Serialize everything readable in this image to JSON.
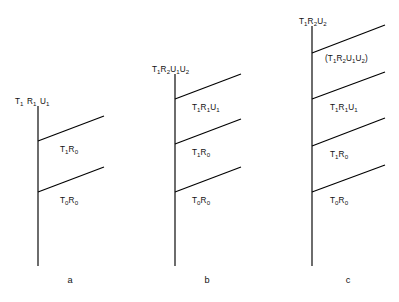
{
  "figure": {
    "type": "energy-level-transition-diagram",
    "background_color": "#ffffff",
    "line_color": "#000000",
    "text_color": "#111111",
    "panels": [
      {
        "id": "a",
        "letter": "a",
        "letter_x": 70,
        "letter_y": 283,
        "trunk": {
          "x": 38,
          "y_top": 106,
          "y_bottom": 266
        },
        "top_label": {
          "text": "T1 R1 U1",
          "parts": [
            {
              "base": "T",
              "sub": "1"
            },
            {
              "space": true
            },
            {
              "base": "R",
              "sub": "1"
            },
            {
              "space": true
            },
            {
              "base": "U",
              "sub": "1"
            }
          ],
          "x": 15,
          "y": 104
        },
        "branches": [
          {
            "name": "branch-T1R0",
            "x1": 38,
            "y1": 141,
            "x2": 104,
            "y2": 116,
            "label": {
              "text": "T1R0",
              "parts": [
                {
                  "base": "T",
                  "sub": "1"
                },
                {
                  "base": "R",
                  "sub": "0"
                }
              ],
              "x": 60,
              "y": 152
            }
          },
          {
            "name": "branch-T0R0",
            "x1": 38,
            "y1": 192,
            "x2": 104,
            "y2": 167,
            "label": {
              "text": "T0R0",
              "parts": [
                {
                  "base": "T",
                  "sub": "0"
                },
                {
                  "base": "R",
                  "sub": "0"
                }
              ],
              "x": 60,
              "y": 203
            }
          }
        ]
      },
      {
        "id": "b",
        "letter": "b",
        "letter_x": 207,
        "letter_y": 283,
        "trunk": {
          "x": 175,
          "y_top": 74,
          "y_bottom": 266
        },
        "top_label": {
          "text": "T1R2U1U2",
          "parts": [
            {
              "base": "T",
              "sub": "1"
            },
            {
              "base": "R",
              "sub": "2"
            },
            {
              "base": "U",
              "sub": "1"
            },
            {
              "base": "U",
              "sub": "2"
            }
          ],
          "x": 152,
          "y": 72
        },
        "branches": [
          {
            "name": "branch-T1R1U1",
            "x1": 175,
            "y1": 99,
            "x2": 241,
            "y2": 74,
            "label": {
              "text": "T1R1U1",
              "parts": [
                {
                  "base": "T",
                  "sub": "1"
                },
                {
                  "base": "R",
                  "sub": "1"
                },
                {
                  "base": "U",
                  "sub": "1"
                }
              ],
              "x": 192,
              "y": 110
            }
          },
          {
            "name": "branch-T1R0",
            "x1": 175,
            "y1": 144,
            "x2": 241,
            "y2": 119,
            "label": {
              "text": "T1R0",
              "parts": [
                {
                  "base": "T",
                  "sub": "1"
                },
                {
                  "base": "R",
                  "sub": "0"
                }
              ],
              "x": 192,
              "y": 155
            }
          },
          {
            "name": "branch-T0R0",
            "x1": 175,
            "y1": 192,
            "x2": 241,
            "y2": 167,
            "label": {
              "text": "T0R0",
              "parts": [
                {
                  "base": "T",
                  "sub": "0"
                },
                {
                  "base": "R",
                  "sub": "0"
                }
              ],
              "x": 192,
              "y": 203
            }
          }
        ]
      },
      {
        "id": "c",
        "letter": "c",
        "letter_x": 348,
        "letter_y": 283,
        "trunk": {
          "x": 312,
          "y_top": 26,
          "y_bottom": 266
        },
        "top_label": {
          "text": "T1R2U2",
          "parts": [
            {
              "base": "T",
              "sub": "1"
            },
            {
              "base": "R",
              "sub": "2"
            },
            {
              "base": "U",
              "sub": "2"
            }
          ],
          "x": 299,
          "y": 24
        },
        "branches": [
          {
            "name": "branch-T1R2U1U2-parenthesized",
            "x1": 312,
            "y1": 53,
            "x2": 385,
            "y2": 25,
            "label": {
              "text": "(T1R2U1U2)",
              "parts": [
                {
                  "base": "(",
                  "sub": ""
                },
                {
                  "base": "T",
                  "sub": "1"
                },
                {
                  "base": "R",
                  "sub": "2"
                },
                {
                  "base": "U",
                  "sub": "1"
                },
                {
                  "base": "U",
                  "sub": "2"
                },
                {
                  "base": ")",
                  "sub": ""
                }
              ],
              "x": 325,
              "y": 61
            }
          },
          {
            "name": "branch-T1R1U1",
            "x1": 312,
            "y1": 99,
            "x2": 385,
            "y2": 72,
            "label": {
              "text": "T1R1U1",
              "parts": [
                {
                  "base": "T",
                  "sub": "1"
                },
                {
                  "base": "R",
                  "sub": "1"
                },
                {
                  "base": "U",
                  "sub": "1"
                }
              ],
              "x": 330,
              "y": 110
            }
          },
          {
            "name": "branch-T1R0",
            "x1": 312,
            "y1": 146,
            "x2": 385,
            "y2": 118,
            "label": {
              "text": "T1R0",
              "parts": [
                {
                  "base": "T",
                  "sub": "1"
                },
                {
                  "base": "R",
                  "sub": "0"
                }
              ],
              "x": 330,
              "y": 157
            }
          },
          {
            "name": "branch-T0R0",
            "x1": 312,
            "y1": 192,
            "x2": 385,
            "y2": 165,
            "label": {
              "text": "T0R0",
              "parts": [
                {
                  "base": "T",
                  "sub": "0"
                },
                {
                  "base": "R",
                  "sub": "0"
                }
              ],
              "x": 330,
              "y": 203
            }
          }
        ]
      }
    ]
  }
}
